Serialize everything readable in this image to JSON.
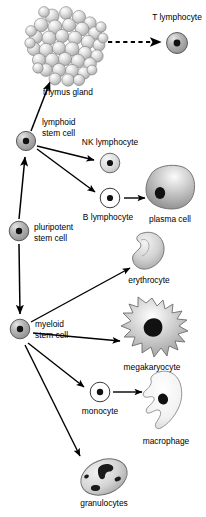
{
  "diagram": {
    "background_color": "#ffffff",
    "ink_color": "#000000",
    "cell_fill_gray": "#a8a8a8",
    "cell_fill_light": "#d8d8d8",
    "cell_fill_white": "#ffffff",
    "nucleus_color": "#111111"
  },
  "labels": {
    "thymus_gland": "thymus gland",
    "t_lymphocyte": "T lymphocyte",
    "lymphoid_stem_cell_line1": "lymphoid",
    "lymphoid_stem_cell_line2": "stem cell",
    "nk_lymphocyte": "NK lymphocyte",
    "b_lymphocyte": "B lymphocyte",
    "plasma_cell": "plasma cell",
    "pluripotent_stem_cell_line1": "pluripotent",
    "pluripotent_stem_cell_line2": "stem cell",
    "erythrocyte": "erythrocyte",
    "myeloid_stem_cell_line1": "myeloid",
    "myeloid_stem_cell_line2": "stem cell",
    "megakaryocyte": "megakaryocyte",
    "monocyte": "monocyte",
    "macrophage": "macrophage",
    "granulocytes": "granulocytes"
  },
  "nodes": [
    {
      "id": "pluripotent-stem-cell",
      "label": "pluripotent stem cell",
      "x": 19,
      "y": 231,
      "shape": "circle-nucleated",
      "fill": "gray"
    },
    {
      "id": "lymphoid-stem-cell",
      "label": "lymphoid stem cell",
      "x": 26,
      "y": 141,
      "shape": "circle-nucleated",
      "fill": "gray"
    },
    {
      "id": "myeloid-stem-cell",
      "label": "myeloid stem cell",
      "x": 20,
      "y": 329,
      "shape": "circle-nucleated",
      "fill": "gray"
    },
    {
      "id": "thymus-gland",
      "label": "thymus gland",
      "x": 68,
      "y": 47,
      "shape": "sphere-cluster",
      "fill": "light"
    },
    {
      "id": "t-lymphocyte",
      "label": "T lymphocyte",
      "x": 177,
      "y": 43,
      "shape": "circle-nucleated",
      "fill": "gray"
    },
    {
      "id": "nk-lymphocyte",
      "label": "NK lymphocyte",
      "x": 110,
      "y": 163,
      "shape": "circle-nucleated",
      "fill": "light"
    },
    {
      "id": "b-lymphocyte",
      "label": "B lymphocyte",
      "x": 110,
      "y": 198,
      "shape": "circle-nucleated",
      "fill": "white"
    },
    {
      "id": "plasma-cell",
      "label": "plasma cell",
      "x": 168,
      "y": 188,
      "shape": "blob",
      "fill": "gray"
    },
    {
      "id": "erythrocyte",
      "label": "erythrocyte",
      "x": 149,
      "y": 254,
      "shape": "bean",
      "fill": "light"
    },
    {
      "id": "megakaryocyte",
      "label": "megakaryocyte",
      "x": 152,
      "y": 330,
      "shape": "spiky",
      "fill": "light"
    },
    {
      "id": "monocyte",
      "label": "monocyte",
      "x": 100,
      "y": 392,
      "shape": "circle-nucleated",
      "fill": "white"
    },
    {
      "id": "macrophage",
      "label": "macrophage",
      "x": 166,
      "y": 403,
      "shape": "amoeboid",
      "fill": "white"
    },
    {
      "id": "granulocytes",
      "label": "granulocytes",
      "x": 104,
      "y": 477,
      "shape": "oval-lobed",
      "fill": "light"
    }
  ],
  "edges": [
    {
      "id": "pluripotent-to-lymphoid",
      "from": "pluripotent-stem-cell",
      "to": "lymphoid-stem-cell",
      "style": "solid"
    },
    {
      "id": "lymphoid-to-thymus",
      "from": "lymphoid-stem-cell",
      "to": "thymus-gland",
      "style": "solid"
    },
    {
      "id": "thymus-to-t-lymphocyte",
      "from": "thymus-gland",
      "to": "t-lymphocyte",
      "style": "dashed"
    },
    {
      "id": "lymphoid-to-nk",
      "from": "lymphoid-stem-cell",
      "to": "nk-lymphocyte",
      "style": "solid"
    },
    {
      "id": "lymphoid-to-b",
      "from": "lymphoid-stem-cell",
      "to": "b-lymphocyte",
      "style": "solid"
    },
    {
      "id": "b-to-plasma-cell",
      "from": "b-lymphocyte",
      "to": "plasma-cell",
      "style": "solid"
    },
    {
      "id": "pluripotent-to-myeloid",
      "from": "pluripotent-stem-cell",
      "to": "myeloid-stem-cell",
      "style": "solid"
    },
    {
      "id": "myeloid-to-erythrocyte",
      "from": "myeloid-stem-cell",
      "to": "erythrocyte",
      "style": "solid"
    },
    {
      "id": "myeloid-to-megakaryocyte",
      "from": "myeloid-stem-cell",
      "to": "megakaryocyte",
      "style": "solid"
    },
    {
      "id": "myeloid-to-monocyte",
      "from": "myeloid-stem-cell",
      "to": "monocyte",
      "style": "solid"
    },
    {
      "id": "myeloid-to-granulocytes",
      "from": "myeloid-stem-cell",
      "to": "granulocytes",
      "style": "solid"
    },
    {
      "id": "monocyte-to-macrophage",
      "from": "monocyte",
      "to": "macrophage",
      "style": "solid"
    }
  ]
}
